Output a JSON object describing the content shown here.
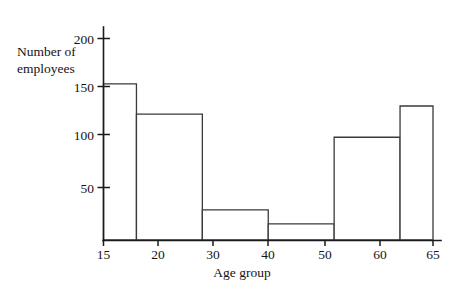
{
  "chart_data": {
    "type": "bar",
    "title": "",
    "subtitle": "",
    "xlabel": "Age group",
    "ylabel_line1": "Number of",
    "ylabel_line2": "employees",
    "ylabel": "Number of employees",
    "categories": [
      "15-20",
      "20-30",
      "30-40",
      "40-50",
      "50-60",
      "60-65"
    ],
    "bin_edges": [
      15,
      20,
      30,
      40,
      50,
      60,
      65
    ],
    "values": [
      155,
      125,
      30,
      16,
      102,
      133
    ],
    "bars": [
      {
        "label": "15-20",
        "start": 15,
        "end": 20,
        "value": 155
      },
      {
        "label": "20-30",
        "start": 20,
        "end": 30,
        "value": 125
      },
      {
        "label": "30-40",
        "start": 30,
        "end": 40,
        "value": 30
      },
      {
        "label": "40-50",
        "start": 40,
        "end": 50,
        "value": 16
      },
      {
        "label": "50-60",
        "start": 50,
        "end": 60,
        "value": 102
      },
      {
        "label": "60-65",
        "start": 60,
        "end": 65,
        "value": 133
      }
    ],
    "xlim": [
      15,
      65
    ],
    "ylim": [
      0,
      210
    ],
    "x_ticks": [
      15,
      20,
      30,
      40,
      50,
      60,
      65
    ],
    "x_tick_labels": [
      "15",
      "20",
      "30",
      "40",
      "50",
      "60",
      "65"
    ],
    "y_ticks": [
      50,
      100,
      150,
      200
    ],
    "y_tick_labels": [
      "50",
      "100",
      "150",
      "200"
    ],
    "grid": false,
    "legend": false,
    "legend_position": "none",
    "bar_fill_color": "#ffffff",
    "bar_edge_color": "#3a3a3a",
    "axis_color": "#1b1b1b",
    "background_color": "#ffffff"
  },
  "labels": {
    "y_200": "200",
    "y_150": "150",
    "y_100": "100",
    "y_50": "50",
    "x_15": "15",
    "x_20": "20",
    "x_30": "30",
    "x_40": "40",
    "x_50": "50",
    "x_60": "60",
    "x_65": "65",
    "axis_title_x": "Age group",
    "axis_title_y_line1": "Number of",
    "axis_title_y_line2": "employees"
  }
}
